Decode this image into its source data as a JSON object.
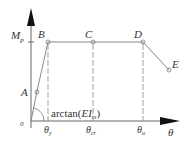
{
  "diagram": {
    "y_axis": {
      "label": "M",
      "subscript": "p"
    },
    "x_axis": {
      "label": "θ"
    },
    "origin": "0",
    "points": [
      {
        "id": "A",
        "label": "A"
      },
      {
        "id": "B",
        "label": "B"
      },
      {
        "id": "C",
        "label": "C"
      },
      {
        "id": "D",
        "label": "D"
      },
      {
        "id": "E",
        "label": "E"
      }
    ],
    "x_ticks": [
      {
        "label": "θ",
        "subscript": "y"
      },
      {
        "label": "θ",
        "subscript": "cr"
      },
      {
        "label": "θ",
        "subscript": "u"
      }
    ],
    "slope_annotation": {
      "prefix": "arctan(",
      "main": "EI",
      "subscript": "cr",
      "suffix": ")"
    },
    "colors": {
      "line": "#888888",
      "axis": "#555555",
      "text": "#333333"
    }
  }
}
